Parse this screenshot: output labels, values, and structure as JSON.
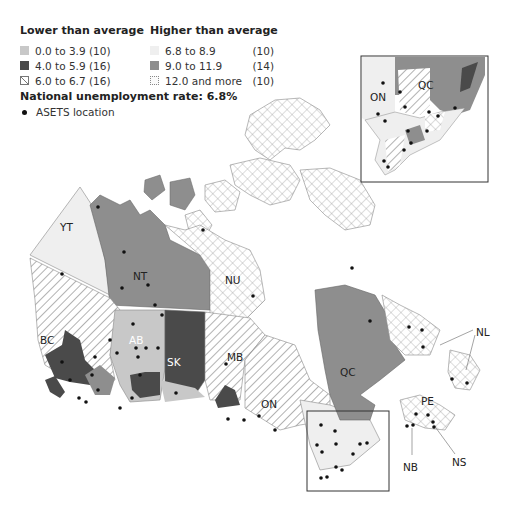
{
  "legend": {
    "lower": {
      "title": "Lower than average",
      "items": [
        {
          "range": "0.0 to 3.9",
          "count": "(10)",
          "style": "light-gray",
          "color": "#c8c8c8"
        },
        {
          "range": "4.0 to 5.9",
          "count": "(16)",
          "style": "dark-gray",
          "color": "#4a4a4a"
        },
        {
          "range": "6.0 to 6.7",
          "count": "(16)",
          "style": "diagonal-hatch",
          "color": "#ffffff"
        }
      ]
    },
    "higher": {
      "title": "Higher than average",
      "items": [
        {
          "range": "6.8 to 8.9",
          "count": "(10)",
          "style": "very-light-gray",
          "color": "#efefef"
        },
        {
          "range": "9.0 to 11.9",
          "count": "(14)",
          "style": "medium-gray",
          "color": "#8e8e8e"
        },
        {
          "range": "12.0 and more",
          "count": "(10)",
          "style": "cross-hatch",
          "color": "#ffffff"
        }
      ]
    },
    "national_rate": "National unemployment rate: 6.8%",
    "asets_label": "ASETS location"
  },
  "map": {
    "provinces": [
      {
        "code": "YT",
        "x": 60,
        "y": 227
      },
      {
        "code": "NT",
        "x": 140,
        "y": 276
      },
      {
        "code": "NU",
        "x": 232,
        "y": 280
      },
      {
        "code": "BC",
        "x": 48,
        "y": 340
      },
      {
        "code": "AB",
        "x": 136,
        "y": 340,
        "white": true
      },
      {
        "code": "SK",
        "x": 174,
        "y": 362,
        "white": true
      },
      {
        "code": "MB",
        "x": 234,
        "y": 357
      },
      {
        "code": "ON",
        "x": 268,
        "y": 404
      },
      {
        "code": "QC",
        "x": 347,
        "y": 372
      },
      {
        "code": "NL",
        "x": 480,
        "y": 332
      },
      {
        "code": "PE",
        "x": 428,
        "y": 401
      },
      {
        "code": "NB",
        "x": 410,
        "y": 467
      },
      {
        "code": "NS",
        "x": 459,
        "y": 462
      }
    ],
    "inset": {
      "labels": [
        {
          "code": "ON",
          "x": 372,
          "y": 98
        },
        {
          "code": "QC",
          "x": 419,
          "y": 88
        }
      ]
    }
  }
}
